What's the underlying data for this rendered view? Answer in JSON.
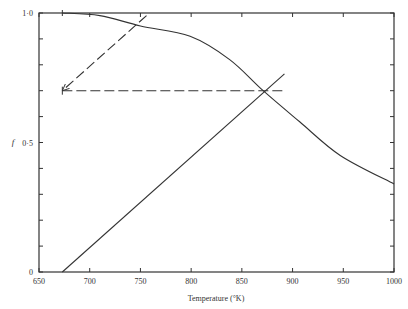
{
  "chart_data": {
    "type": "line",
    "title": "",
    "xlabel": "Temperature (°K)",
    "ylabel": "f",
    "xlim": [
      650,
      1000
    ],
    "ylim": [
      0,
      1.0
    ],
    "x_ticks": [
      650,
      700,
      750,
      800,
      850,
      900,
      950,
      1000
    ],
    "x_tick_labels": [
      "650",
      "700",
      "750",
      "800",
      "850",
      "900",
      "950",
      "1000"
    ],
    "y_ticks": [
      0,
      0.1,
      0.2,
      0.3,
      0.4,
      0.5,
      0.6,
      0.7,
      0.8,
      0.9,
      1.0
    ],
    "y_tick_labels": {
      "0": "0",
      "0.5": "0·5",
      "1.0": "1·0"
    },
    "grid": false,
    "legend": null,
    "series": [
      {
        "name": "decreasing curve",
        "style": "solid",
        "x": [
          673,
          710,
          750,
          799,
          838,
          871,
          907,
          947,
          1000
        ],
        "y": [
          1.0,
          0.99,
          0.95,
          0.91,
          0.82,
          0.7,
          0.58,
          0.45,
          0.34
        ]
      },
      {
        "name": "rising line",
        "style": "solid",
        "x": [
          673,
          892
        ],
        "y": [
          0.0,
          0.765
        ]
      },
      {
        "name": "horizontal construction line",
        "style": "dashed",
        "x": [
          673,
          890
        ],
        "y": [
          0.7,
          0.7
        ]
      },
      {
        "name": "diagonal construction arrow",
        "style": "dashed-arrow",
        "x": [
          756,
          673
        ],
        "y": [
          0.99,
          0.7
        ]
      }
    ],
    "annotations": [
      {
        "type": "intersection",
        "x": 871,
        "y": 0.7
      }
    ]
  }
}
